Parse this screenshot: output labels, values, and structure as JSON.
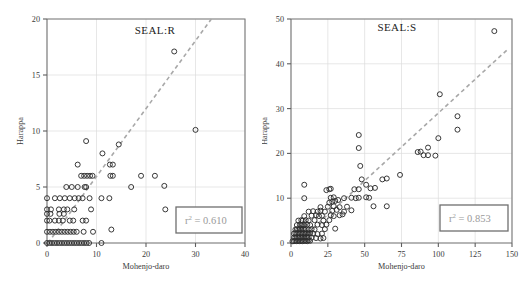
{
  "figure": {
    "width": 524,
    "height": 288,
    "background": "#ffffff",
    "marker_color": "#2e2e2e",
    "trend_color": "#a8a8a8",
    "grid_color": "#dcdcdc",
    "axis_color": "#6d6d6d",
    "stat_text_color": "#9a9a9a"
  },
  "chart_data": [
    {
      "type": "scatter",
      "panel_id": "left",
      "title": "SEAL:R",
      "xlabel": "Mohenjo-daro",
      "ylabel": "Harappa",
      "xlim": [
        0,
        40
      ],
      "ylim": [
        0,
        20
      ],
      "xticks": [
        0,
        10,
        20,
        30,
        40
      ],
      "yticks": [
        0,
        5,
        10,
        15,
        20
      ],
      "xticklabels": [
        "0",
        "10",
        "20",
        "30",
        "40"
      ],
      "yticklabels": [
        "0",
        "5",
        "10",
        "15",
        "20"
      ],
      "grid": true,
      "legend": false,
      "annotation": {
        "text": "r2 = 0.610",
        "base": "r",
        "superscript": "2",
        "tail": " = 0.610",
        "value": 0.61,
        "boxed": true
      },
      "trendline": {
        "type": "linear-dashed",
        "x": [
          0.2,
          33.2
        ],
        "y": [
          0.0,
          20.0
        ]
      },
      "points": [
        [
          0,
          0
        ],
        [
          0.5,
          0
        ],
        [
          1,
          0
        ],
        [
          1.5,
          0
        ],
        [
          2,
          0
        ],
        [
          2.5,
          0
        ],
        [
          3,
          0
        ],
        [
          3.5,
          0
        ],
        [
          4,
          0
        ],
        [
          4.5,
          0
        ],
        [
          5,
          0
        ],
        [
          5.5,
          0
        ],
        [
          6,
          0
        ],
        [
          6.5,
          0
        ],
        [
          7,
          0
        ],
        [
          7.5,
          0
        ],
        [
          8,
          0
        ],
        [
          8.5,
          0
        ],
        [
          11,
          0
        ],
        [
          0,
          1
        ],
        [
          0.6,
          1
        ],
        [
          1.2,
          1
        ],
        [
          1.8,
          1
        ],
        [
          2.4,
          1
        ],
        [
          3,
          1
        ],
        [
          3.6,
          1
        ],
        [
          4.2,
          1
        ],
        [
          4.8,
          1
        ],
        [
          5.4,
          1
        ],
        [
          6,
          1
        ],
        [
          7.4,
          1
        ],
        [
          9.3,
          1
        ],
        [
          13,
          1.2
        ],
        [
          0,
          2
        ],
        [
          0.5,
          2
        ],
        [
          1.6,
          2
        ],
        [
          2.4,
          2
        ],
        [
          3.2,
          2
        ],
        [
          4.6,
          2
        ],
        [
          5.3,
          2
        ],
        [
          7.2,
          2
        ],
        [
          7.9,
          2
        ],
        [
          0,
          2.6
        ],
        [
          0.7,
          2.6
        ],
        [
          2.5,
          2.6
        ],
        [
          3.4,
          2.6
        ],
        [
          0,
          3
        ],
        [
          0.8,
          3
        ],
        [
          2.4,
          3
        ],
        [
          3.4,
          3
        ],
        [
          4.1,
          3
        ],
        [
          5.5,
          3
        ],
        [
          8.9,
          3
        ],
        [
          23.9,
          3
        ],
        [
          0,
          4
        ],
        [
          1.6,
          4
        ],
        [
          2.6,
          4
        ],
        [
          3.6,
          4
        ],
        [
          4.6,
          4
        ],
        [
          5.6,
          4
        ],
        [
          6.4,
          4
        ],
        [
          7.2,
          4
        ],
        [
          8.6,
          4
        ],
        [
          11,
          4
        ],
        [
          12.6,
          4
        ],
        [
          3.9,
          5
        ],
        [
          5,
          5
        ],
        [
          6.2,
          5
        ],
        [
          7.6,
          5
        ],
        [
          7.9,
          5
        ],
        [
          17,
          5
        ],
        [
          23.7,
          5.1
        ],
        [
          6.9,
          6
        ],
        [
          7.5,
          6
        ],
        [
          8.1,
          6
        ],
        [
          8.7,
          6
        ],
        [
          9.2,
          6
        ],
        [
          12.8,
          6
        ],
        [
          13.3,
          6
        ],
        [
          19,
          6
        ],
        [
          21.8,
          6
        ],
        [
          6.2,
          7
        ],
        [
          12.7,
          7
        ],
        [
          13.3,
          7
        ],
        [
          11.2,
          8
        ],
        [
          14.5,
          8.8
        ],
        [
          7.9,
          9.1
        ],
        [
          30,
          10.1
        ],
        [
          25.7,
          17.1
        ]
      ]
    },
    {
      "type": "scatter",
      "panel_id": "right",
      "title": "SEAL:S",
      "xlabel": "Mohenjo-daro",
      "ylabel": "Harappa",
      "xlim": [
        0,
        150
      ],
      "ylim": [
        0,
        50
      ],
      "xticks": [
        0,
        25,
        50,
        75,
        100,
        125,
        150
      ],
      "yticks": [
        0,
        10,
        20,
        30,
        40,
        50
      ],
      "xticklabels": [
        "0",
        "25",
        "50",
        "75",
        "100",
        "125",
        "150"
      ],
      "yticklabels": [
        "0",
        "10",
        "20",
        "30",
        "40",
        "50"
      ],
      "grid": true,
      "legend": false,
      "annotation": {
        "text": "r2 = 0.853",
        "base": "r",
        "superscript": "2",
        "tail": " = 0.853",
        "value": 0.853,
        "boxed": true
      },
      "trendline": {
        "type": "linear-dashed",
        "x": [
          4,
          147
        ],
        "y": [
          0.0,
          43.2
        ]
      },
      "points": [
        [
          1,
          0.4
        ],
        [
          2,
          0.4
        ],
        [
          3,
          0.5
        ],
        [
          4,
          0.4
        ],
        [
          5,
          0.5
        ],
        [
          6,
          0.4
        ],
        [
          7,
          0.5
        ],
        [
          8,
          0.4
        ],
        [
          9,
          0.5
        ],
        [
          10,
          0.5
        ],
        [
          11,
          0.4
        ],
        [
          12,
          0.6
        ],
        [
          13,
          0.5
        ],
        [
          2,
          1.2
        ],
        [
          3,
          1.2
        ],
        [
          4,
          1.3
        ],
        [
          5,
          1.2
        ],
        [
          6,
          1.3
        ],
        [
          7,
          1.2
        ],
        [
          8,
          1.3
        ],
        [
          9,
          1.2
        ],
        [
          10,
          1.3
        ],
        [
          11,
          1.2
        ],
        [
          12,
          1.3
        ],
        [
          14,
          1.2
        ],
        [
          17,
          1.1
        ],
        [
          20,
          1.0
        ],
        [
          22,
          1.1
        ],
        [
          2,
          2.1
        ],
        [
          3,
          2.2
        ],
        [
          4,
          2.1
        ],
        [
          5,
          2.2
        ],
        [
          6,
          2.1
        ],
        [
          7,
          2.2
        ],
        [
          8,
          2.1
        ],
        [
          9,
          2.2
        ],
        [
          10,
          2.1
        ],
        [
          11,
          2.2
        ],
        [
          12,
          2.1
        ],
        [
          13,
          2.2
        ],
        [
          15,
          2.1
        ],
        [
          18,
          2.0
        ],
        [
          21,
          2.1
        ],
        [
          3,
          3.0
        ],
        [
          4,
          3.1
        ],
        [
          5,
          3.0
        ],
        [
          6,
          3.1
        ],
        [
          7,
          3.0
        ],
        [
          8,
          3.1
        ],
        [
          9,
          3.0
        ],
        [
          10,
          3.1
        ],
        [
          12,
          3.0
        ],
        [
          14,
          3.1
        ],
        [
          16,
          3.0
        ],
        [
          23,
          3.1
        ],
        [
          30,
          3.2
        ],
        [
          4,
          4.0
        ],
        [
          6,
          4.1
        ],
        [
          7,
          4.0
        ],
        [
          8,
          4.1
        ],
        [
          9,
          4.0
        ],
        [
          11,
          4.1
        ],
        [
          13,
          4.0
        ],
        [
          18,
          4.1
        ],
        [
          21,
          4.0
        ],
        [
          24,
          4.1
        ],
        [
          5,
          5.0
        ],
        [
          7,
          5.1
        ],
        [
          8,
          5.0
        ],
        [
          10,
          5.1
        ],
        [
          12,
          5.0
        ],
        [
          16,
          5.1
        ],
        [
          22,
          5.0
        ],
        [
          26,
          5.1
        ],
        [
          9,
          6.0
        ],
        [
          14,
          6.1
        ],
        [
          17,
          6.2
        ],
        [
          19,
          6.0
        ],
        [
          21,
          6.1
        ],
        [
          27,
          6.2
        ],
        [
          29,
          6.0
        ],
        [
          33,
          6.2
        ],
        [
          35,
          6.4
        ],
        [
          12,
          7.0
        ],
        [
          15,
          7.1
        ],
        [
          18,
          7.0
        ],
        [
          20,
          7.2
        ],
        [
          23,
          7.0
        ],
        [
          28,
          7.2
        ],
        [
          31,
          7.4
        ],
        [
          36,
          7.0
        ],
        [
          41,
          7.3
        ],
        [
          20,
          8.0
        ],
        [
          25,
          8.1
        ],
        [
          29,
          8.2
        ],
        [
          33,
          8.0
        ],
        [
          38,
          8.1
        ],
        [
          56,
          8.2
        ],
        [
          65,
          8.2
        ],
        [
          26,
          9.0
        ],
        [
          28,
          9.2
        ],
        [
          30,
          9.4
        ],
        [
          32,
          9.6
        ],
        [
          9,
          10.0
        ],
        [
          27,
          10.1
        ],
        [
          29,
          10.2
        ],
        [
          36,
          10.0
        ],
        [
          41,
          10.1
        ],
        [
          44,
          10.0
        ],
        [
          46,
          10.1
        ],
        [
          51,
          10.2
        ],
        [
          53,
          10.1
        ],
        [
          24,
          11.8
        ],
        [
          26,
          12.0
        ],
        [
          27,
          12.1
        ],
        [
          43,
          12.0
        ],
        [
          46,
          12.0
        ],
        [
          9,
          13.0
        ],
        [
          51,
          13.0
        ],
        [
          54,
          12.2
        ],
        [
          57,
          12.3
        ],
        [
          48,
          14.2
        ],
        [
          62,
          14.2
        ],
        [
          65,
          14.4
        ],
        [
          74,
          15.2
        ],
        [
          47,
          17.2
        ],
        [
          86,
          20.3
        ],
        [
          88,
          20.4
        ],
        [
          90,
          19.6
        ],
        [
          93,
          19.6
        ],
        [
          98,
          19.5
        ],
        [
          46,
          21.2
        ],
        [
          93,
          21.3
        ],
        [
          100,
          23.4
        ],
        [
          113,
          25.3
        ],
        [
          46,
          24.1
        ],
        [
          113,
          28.3
        ],
        [
          101,
          33.2
        ],
        [
          138,
          47.3
        ]
      ]
    }
  ]
}
